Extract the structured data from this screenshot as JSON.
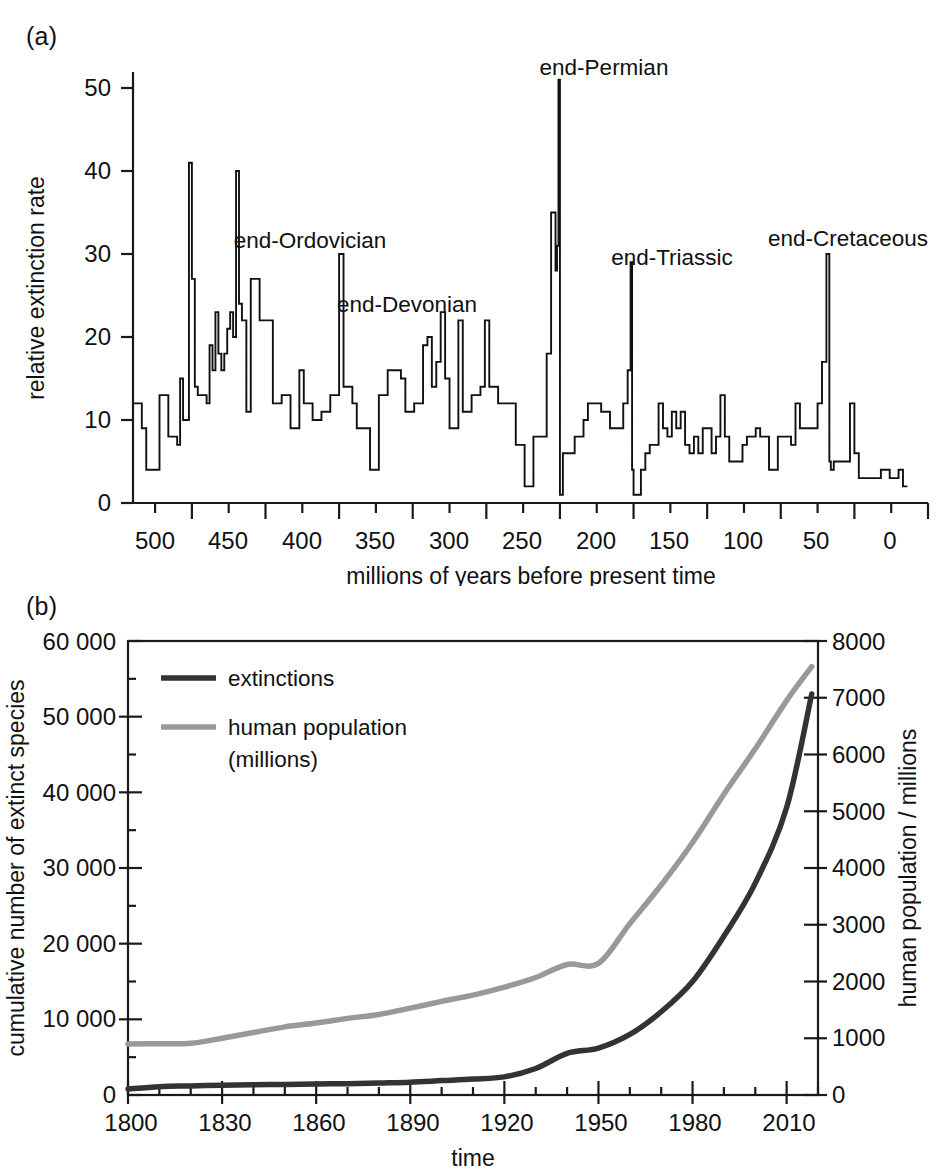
{
  "figure": {
    "panel_a_tag": "(a)",
    "panel_b_tag": "(b)"
  },
  "panel_a": {
    "xlabel": "millions of years before present time",
    "ylabel": "relative extinction rate",
    "x_ticks": [
      "500",
      "450",
      "400",
      "350",
      "300",
      "250",
      "200",
      "150",
      "100",
      "50",
      "0"
    ],
    "y_ticks": [
      "0",
      "10",
      "20",
      "30",
      "40",
      "50"
    ],
    "event_labels": [
      {
        "id": "end-ordovician",
        "text": "end-Ordovician"
      },
      {
        "id": "end-devonian",
        "text": "end-Devonian"
      },
      {
        "id": "end-permian",
        "text": "end-Permian"
      },
      {
        "id": "end-triassic",
        "text": "end-Triassic"
      },
      {
        "id": "end-cretaceous",
        "text": "end-Cretaceous"
      }
    ]
  },
  "panel_b": {
    "xlabel": "time",
    "ylabel_left": "cumulative number of extinct species",
    "ylabel_right": "human population / millions",
    "x_ticks": [
      "1800",
      "1830",
      "1860",
      "1890",
      "1920",
      "1950",
      "1980",
      "2010"
    ],
    "y_ticks_left": [
      "0",
      "10 000",
      "20 000",
      "30 000",
      "40 000",
      "50 000",
      "60 000"
    ],
    "y_ticks_right": [
      "0",
      "1000",
      "2000",
      "3000",
      "4000",
      "5000",
      "6000",
      "7000",
      "8000"
    ],
    "legend": [
      {
        "id": "extinctions",
        "label": "extinctions",
        "color": "#333333"
      },
      {
        "id": "human-population",
        "label": "human population",
        "label2": "(millions)",
        "color": "#999999"
      }
    ]
  },
  "chart_data": [
    {
      "type": "line",
      "id": "panel-a-extinction-rate",
      "title": "(a) relative extinction rate vs geological time",
      "xlabel": "millions of years before present time",
      "ylabel": "relative extinction rate",
      "xlim": [
        540,
        0
      ],
      "ylim": [
        0,
        55
      ],
      "x_reversed": true,
      "grid": false,
      "legend": "none",
      "step": true,
      "annotations": [
        {
          "text": "end-Ordovician",
          "x": 445,
          "y": 30
        },
        {
          "text": "end-Devonian",
          "x": 375,
          "y": 23
        },
        {
          "text": "end-Permian",
          "x": 252,
          "y": 51
        },
        {
          "text": "end-Triassic",
          "x": 201,
          "y": 29
        },
        {
          "text": "end-Cretaceous",
          "x": 66,
          "y": 30
        }
      ],
      "x": [
        540,
        537,
        534,
        531,
        528,
        525,
        522,
        519,
        516,
        513,
        510,
        508,
        506,
        504,
        502,
        500,
        498,
        496,
        494,
        492,
        490,
        488,
        486,
        484,
        482,
        480,
        478,
        476,
        474,
        472,
        470,
        468,
        466,
        463,
        460,
        457,
        454,
        451,
        448,
        445,
        442,
        439,
        436,
        433,
        430,
        427,
        424,
        421,
        418,
        415,
        412,
        409,
        406,
        403,
        400,
        397,
        394,
        391,
        388,
        385,
        382,
        379,
        376,
        373,
        370,
        367,
        364,
        361,
        358,
        355,
        352,
        349,
        346,
        343,
        340,
        337,
        334,
        331,
        328,
        325,
        322,
        319,
        316,
        313,
        310,
        307,
        304,
        301,
        298,
        295,
        292,
        289,
        286,
        283,
        280,
        277,
        274,
        271,
        268,
        265,
        262,
        259,
        256,
        253,
        252,
        251,
        250,
        249,
        248,
        246,
        243,
        240,
        237,
        234,
        231,
        228,
        225,
        222,
        219,
        216,
        213,
        210,
        207,
        204,
        202,
        201,
        200,
        198,
        195,
        192,
        189,
        186,
        183,
        180,
        177,
        174,
        171,
        168,
        165,
        162,
        159,
        156,
        153,
        150,
        147,
        144,
        141,
        138,
        135,
        132,
        129,
        126,
        123,
        120,
        117,
        114,
        111,
        108,
        105,
        102,
        99,
        96,
        93,
        90,
        87,
        84,
        81,
        78,
        75,
        72,
        69,
        67,
        66,
        65,
        64,
        62,
        59,
        56,
        53,
        50,
        47,
        44,
        41,
        38,
        35,
        32,
        29,
        26,
        23,
        20,
        17,
        14,
        11,
        8,
        5,
        2,
        0
      ],
      "y": [
        12,
        12,
        9,
        4,
        4,
        4,
        13,
        13,
        8,
        8,
        7,
        15,
        10,
        10,
        41,
        27,
        14,
        13,
        13,
        13,
        12,
        19,
        16,
        23,
        18,
        16,
        18,
        21,
        23,
        20,
        40,
        24,
        22,
        11,
        27,
        27,
        22,
        22,
        22,
        12,
        12,
        13,
        13,
        9,
        9,
        16,
        12,
        12,
        10,
        10,
        11,
        11,
        13,
        13,
        30,
        14,
        14,
        12,
        9,
        9,
        9,
        4,
        4,
        13,
        13,
        16,
        16,
        16,
        15,
        11,
        11,
        12,
        12,
        19,
        20,
        14,
        17,
        23,
        15,
        9,
        9,
        22,
        11,
        11,
        13,
        13,
        14,
        22,
        14,
        14,
        12,
        12,
        12,
        12,
        7,
        7,
        2,
        2,
        8,
        8,
        8,
        18,
        35,
        28,
        31,
        51,
        1,
        1,
        6,
        6,
        6,
        8,
        8,
        10,
        12,
        12,
        12,
        11,
        11,
        9,
        9,
        9,
        12,
        16,
        29,
        4,
        1,
        1,
        4,
        6,
        7,
        7,
        12,
        9,
        8,
        11,
        9,
        11,
        7,
        6,
        8,
        6,
        9,
        9,
        6,
        8,
        13,
        8,
        5,
        5,
        5,
        7,
        8,
        8,
        9,
        8,
        8,
        4,
        4,
        8,
        8,
        8,
        7,
        12,
        9,
        9,
        9,
        9,
        12,
        17,
        30,
        5,
        4,
        4,
        5,
        5,
        5,
        5,
        12,
        6,
        3,
        3,
        3,
        3,
        3,
        4,
        4,
        3,
        3,
        4,
        2
      ]
    },
    {
      "type": "line",
      "id": "panel-b-extinctions-and-population",
      "title": "(b) cumulative extinctions and human population since 1800",
      "xlabel": "time",
      "ylabel": "cumulative number of extinct species",
      "ylabel_right": "human population / millions",
      "xlim": [
        1800,
        2020
      ],
      "ylim": [
        0,
        60000
      ],
      "ylim_right": [
        0,
        8000
      ],
      "grid": false,
      "legend": "top-left",
      "x": [
        1800,
        1810,
        1820,
        1830,
        1840,
        1850,
        1860,
        1870,
        1880,
        1890,
        1900,
        1910,
        1920,
        1930,
        1940,
        1950,
        1960,
        1970,
        1980,
        1990,
        2000,
        2010,
        2018
      ],
      "series": [
        {
          "name": "extinctions",
          "axis": "left",
          "color": "#333333",
          "values": [
            800,
            1100,
            1200,
            1300,
            1350,
            1400,
            1450,
            1500,
            1600,
            1700,
            1900,
            2100,
            2400,
            3500,
            5500,
            6200,
            8000,
            11000,
            15000,
            21000,
            28000,
            38000,
            53000
          ]
        },
        {
          "name": "human population (millions)",
          "axis": "right",
          "color": "#999999",
          "values": [
            900,
            905,
            910,
            1000,
            1100,
            1200,
            1270,
            1350,
            1420,
            1530,
            1650,
            1760,
            1900,
            2070,
            2300,
            2320,
            3020,
            3700,
            4450,
            5300,
            6100,
            6950,
            7550
          ]
        }
      ]
    }
  ]
}
